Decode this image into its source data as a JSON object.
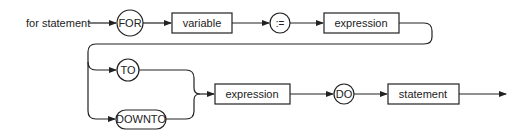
{
  "diagram": {
    "type": "syntax-diagram",
    "title": "for statement",
    "nodes": {
      "for_kw": "FOR",
      "variable": "variable",
      "assign": ":=",
      "expression1": "expression",
      "to_kw": "TO",
      "downto_kw": "DOWNTO",
      "expression2": "expression",
      "do_kw": "DO",
      "statement": "statement"
    },
    "colors": {
      "stroke": "#222222",
      "background": "#ffffff"
    }
  }
}
